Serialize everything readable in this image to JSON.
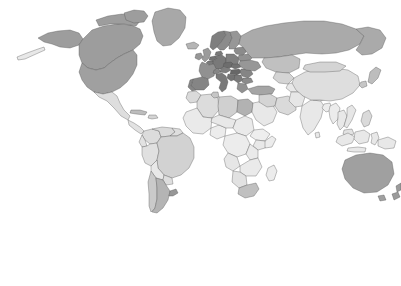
{
  "figure": {
    "type": "choropleth-world-map",
    "background_color": "#ffffff"
  },
  "legend": {
    "label": "ASR (world) incidence men",
    "ticks": [
      {
        "value": "0",
        "position_pct": 3.2
      },
      {
        "value": "10",
        "position_pct": 35.6
      },
      {
        "value": "20",
        "position_pct": 68.0
      },
      {
        "value": "30",
        "position_pct": 100.0
      }
    ],
    "scale_min": 0,
    "scale_max": 30,
    "color_low": "#fdfdfd",
    "color_high": "#5e5e5e",
    "gradient_stops": [
      "#fdfdfd",
      "#e6e6e6",
      "#c4c4c4",
      "#9a9a9a",
      "#6d6d6d",
      "#5e5e5e"
    ]
  },
  "chart_data": {
    "type": "heatmap",
    "title": "",
    "xlabel": "",
    "ylabel": "",
    "legend_title": "ASR (world) incidence men",
    "unit": "ASR (world) incidence per 100,000 men",
    "colorbar_range": [
      0,
      30
    ],
    "colorbar_ticks": [
      0,
      10,
      20,
      30
    ],
    "colorbar_colors": [
      "#fdfdfd",
      "#5e5e5e"
    ],
    "legend_position": "bottom",
    "grid": false,
    "projection": "world-equirectangular",
    "no_data_color": "#ffffff",
    "regions": [
      {
        "name": "Canada",
        "value": 19.5,
        "fill": "#9d9d9d"
      },
      {
        "name": "Alaska",
        "value": 19.5,
        "fill": "#9d9d9d"
      },
      {
        "name": "United States",
        "value": 19.0,
        "fill": "#a0a0a0"
      },
      {
        "name": "Greenland",
        "value": 17.5,
        "fill": "#a8a8a8"
      },
      {
        "name": "Mexico",
        "value": 7.0,
        "fill": "#dedede"
      },
      {
        "name": "Central America",
        "value": 6.0,
        "fill": "#e2e2e2"
      },
      {
        "name": "Cuba",
        "value": 14.0,
        "fill": "#bdbdbd"
      },
      {
        "name": "Caribbean",
        "value": 9.0,
        "fill": "#d4d4d4"
      },
      {
        "name": "Colombia",
        "value": 7.5,
        "fill": "#dcdcdc"
      },
      {
        "name": "Venezuela",
        "value": 8.0,
        "fill": "#dadada"
      },
      {
        "name": "Brazil",
        "value": 9.5,
        "fill": "#d2d2d2"
      },
      {
        "name": "Peru",
        "value": 6.5,
        "fill": "#e0e0e0"
      },
      {
        "name": "Bolivia",
        "value": 5.0,
        "fill": "#e8e8e8"
      },
      {
        "name": "Chile",
        "value": 11.0,
        "fill": "#cacaca"
      },
      {
        "name": "Argentina",
        "value": 15.5,
        "fill": "#b4b4b4"
      },
      {
        "name": "Uruguay",
        "value": 21.0,
        "fill": "#979797"
      },
      {
        "name": "Paraguay",
        "value": 7.0,
        "fill": "#dedede"
      },
      {
        "name": "Ecuador",
        "value": 6.0,
        "fill": "#e2e2e2"
      },
      {
        "name": "Guyana",
        "value": 7.0,
        "fill": "#dedede"
      },
      {
        "name": "Morocco",
        "value": 8.0,
        "fill": "#dadada"
      },
      {
        "name": "Algeria",
        "value": 7.5,
        "fill": "#dcdcdc"
      },
      {
        "name": "Libya",
        "value": 10.0,
        "fill": "#d0d0d0"
      },
      {
        "name": "Egypt",
        "value": 16.0,
        "fill": "#b2b2b2"
      },
      {
        "name": "Tunisia",
        "value": 12.0,
        "fill": "#c6c6c6"
      },
      {
        "name": "Sudan",
        "value": 4.5,
        "fill": "#eaeaea"
      },
      {
        "name": "Nigeria",
        "value": 4.0,
        "fill": "#ececec"
      },
      {
        "name": "Ethiopia",
        "value": 3.5,
        "fill": "#eeeeee"
      },
      {
        "name": "Kenya",
        "value": 5.0,
        "fill": "#e8e8e8"
      },
      {
        "name": "Tanzania",
        "value": 4.5,
        "fill": "#eaeaea"
      },
      {
        "name": "Congo DR",
        "value": 4.0,
        "fill": "#ececec"
      },
      {
        "name": "Angola",
        "value": 5.5,
        "fill": "#e6e6e6"
      },
      {
        "name": "South Africa",
        "value": 13.0,
        "fill": "#c0c0c0"
      },
      {
        "name": "Namibia",
        "value": 6.0,
        "fill": "#e2e2e2"
      },
      {
        "name": "Madagascar",
        "value": 4.0,
        "fill": "#ececec"
      },
      {
        "name": "West Africa",
        "value": 4.5,
        "fill": "#eaeaea"
      },
      {
        "name": "Norway",
        "value": 25.0,
        "fill": "#7f7f7f"
      },
      {
        "name": "Sweden",
        "value": 23.0,
        "fill": "#8b8b8b"
      },
      {
        "name": "Finland",
        "value": 21.0,
        "fill": "#979797"
      },
      {
        "name": "United Kingdom",
        "value": 20.0,
        "fill": "#9b9b9b"
      },
      {
        "name": "Ireland",
        "value": 21.0,
        "fill": "#979797"
      },
      {
        "name": "France",
        "value": 22.0,
        "fill": "#919191"
      },
      {
        "name": "Spain",
        "value": 24.0,
        "fill": "#858585"
      },
      {
        "name": "Portugal",
        "value": 24.0,
        "fill": "#858585"
      },
      {
        "name": "Germany",
        "value": 26.0,
        "fill": "#797979"
      },
      {
        "name": "Netherlands",
        "value": 27.0,
        "fill": "#737373"
      },
      {
        "name": "Belgium",
        "value": 26.0,
        "fill": "#797979"
      },
      {
        "name": "Denmark",
        "value": 26.0,
        "fill": "#797979"
      },
      {
        "name": "Poland",
        "value": 25.0,
        "fill": "#7f7f7f"
      },
      {
        "name": "Czechia",
        "value": 28.0,
        "fill": "#6d6d6d"
      },
      {
        "name": "Slovakia",
        "value": 27.0,
        "fill": "#737373"
      },
      {
        "name": "Hungary",
        "value": 29.0,
        "fill": "#676767"
      },
      {
        "name": "Austria",
        "value": 25.0,
        "fill": "#7f7f7f"
      },
      {
        "name": "Switzerland",
        "value": 24.0,
        "fill": "#858585"
      },
      {
        "name": "Italy",
        "value": 26.0,
        "fill": "#797979"
      },
      {
        "name": "Croatia",
        "value": 27.0,
        "fill": "#737373"
      },
      {
        "name": "Serbia",
        "value": 26.0,
        "fill": "#797979"
      },
      {
        "name": "Romania",
        "value": 24.0,
        "fill": "#858585"
      },
      {
        "name": "Bulgaria",
        "value": 23.0,
        "fill": "#8b8b8b"
      },
      {
        "name": "Greece",
        "value": 22.0,
        "fill": "#919191"
      },
      {
        "name": "Ukraine",
        "value": 21.0,
        "fill": "#979797"
      },
      {
        "name": "Belarus",
        "value": 22.0,
        "fill": "#919191"
      },
      {
        "name": "Baltic States",
        "value": 23.0,
        "fill": "#8b8b8b"
      },
      {
        "name": "Turkey",
        "value": 18.0,
        "fill": "#a5a5a5"
      },
      {
        "name": "Russia",
        "value": 17.0,
        "fill": "#aaaaaa"
      },
      {
        "name": "Kazakhstan",
        "value": 13.0,
        "fill": "#c0c0c0"
      },
      {
        "name": "Iran",
        "value": 8.0,
        "fill": "#dadada"
      },
      {
        "name": "Iraq",
        "value": 7.0,
        "fill": "#dedede"
      },
      {
        "name": "Saudi Arabia",
        "value": 5.0,
        "fill": "#e8e8e8"
      },
      {
        "name": "Syria",
        "value": 9.0,
        "fill": "#d4d4d4"
      },
      {
        "name": "Israel",
        "value": 16.0,
        "fill": "#b2b2b2"
      },
      {
        "name": "Central Asia",
        "value": 9.0,
        "fill": "#d4d4d4"
      },
      {
        "name": "Afghanistan",
        "value": 5.0,
        "fill": "#e8e8e8"
      },
      {
        "name": "Pakistan",
        "value": 5.5,
        "fill": "#e6e6e6"
      },
      {
        "name": "India",
        "value": 5.0,
        "fill": "#e8e8e8"
      },
      {
        "name": "Bangladesh",
        "value": 4.0,
        "fill": "#ececec"
      },
      {
        "name": "China",
        "value": 7.0,
        "fill": "#dedede"
      },
      {
        "name": "Mongolia",
        "value": 9.0,
        "fill": "#d4d4d4"
      },
      {
        "name": "Japan",
        "value": 14.0,
        "fill": "#bdbdbd"
      },
      {
        "name": "South Korea",
        "value": 12.0,
        "fill": "#c6c6c6"
      },
      {
        "name": "Thailand",
        "value": 5.0,
        "fill": "#e8e8e8"
      },
      {
        "name": "Vietnam",
        "value": 5.5,
        "fill": "#e6e6e6"
      },
      {
        "name": "Philippines",
        "value": 8.0,
        "fill": "#dadada"
      },
      {
        "name": "Indonesia",
        "value": 5.0,
        "fill": "#e8e8e8"
      },
      {
        "name": "Malaysia",
        "value": 6.0,
        "fill": "#e2e2e2"
      },
      {
        "name": "Myanmar",
        "value": 4.0,
        "fill": "#ececec"
      },
      {
        "name": "Papua New Guinea",
        "value": 5.0,
        "fill": "#e8e8e8"
      },
      {
        "name": "Australia",
        "value": 19.0,
        "fill": "#a0a0a0"
      },
      {
        "name": "New Zealand",
        "value": 20.0,
        "fill": "#9b9b9b"
      }
    ]
  }
}
